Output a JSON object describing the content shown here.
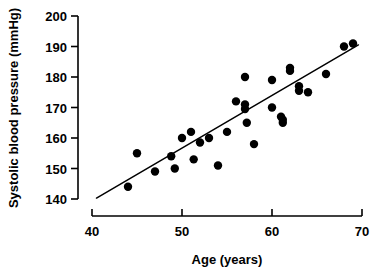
{
  "chart_data": {
    "type": "scatter",
    "title": "",
    "subtitle": "",
    "xlabel": "Age (years)",
    "ylabel": "Systolic blood pressure (mmHg)",
    "xlim": [
      40,
      70
    ],
    "ylim": [
      140,
      200
    ],
    "xticks": [
      40,
      50,
      60,
      70
    ],
    "xtick_labels": [
      "40",
      "50",
      "60",
      "70"
    ],
    "yticks": [
      140,
      150,
      160,
      170,
      180,
      190,
      200
    ],
    "ytick_labels": [
      "140",
      "150",
      "160",
      "170",
      "180",
      "190",
      "200"
    ],
    "grid": false,
    "legend": null,
    "legend_position": "none",
    "marker": "filled-circle",
    "marker_color": "#000000",
    "marker_size": 4.2,
    "series": [
      {
        "name": "Subjects",
        "points": [
          [
            44.0,
            144.0
          ],
          [
            45.0,
            155.0
          ],
          [
            47.0,
            149.0
          ],
          [
            48.8,
            154.0
          ],
          [
            49.2,
            150.0
          ],
          [
            50.0,
            160.0
          ],
          [
            51.0,
            162.0
          ],
          [
            51.3,
            153.0
          ],
          [
            52.0,
            158.5
          ],
          [
            53.0,
            160.0
          ],
          [
            54.0,
            151.0
          ],
          [
            55.0,
            162.0
          ],
          [
            56.0,
            172.0
          ],
          [
            57.0,
            180.0
          ],
          [
            57.0,
            171.0
          ],
          [
            57.0,
            169.5
          ],
          [
            57.2,
            165.0
          ],
          [
            58.0,
            158.0
          ],
          [
            60.0,
            179.0
          ],
          [
            60.0,
            170.0
          ],
          [
            61.0,
            167.0
          ],
          [
            61.2,
            166.0
          ],
          [
            61.2,
            165.0
          ],
          [
            62.0,
            183.0
          ],
          [
            62.0,
            182.0
          ],
          [
            63.0,
            177.0
          ],
          [
            63.0,
            175.5
          ],
          [
            64.0,
            175.0
          ],
          [
            66.0,
            181.0
          ],
          [
            68.0,
            190.0
          ],
          [
            69.0,
            191.0
          ]
        ]
      }
    ],
    "fit_line": {
      "name": "least-squares regression line",
      "x_start": 40.5,
      "y_start": 140.3,
      "x_end": 69.6,
      "y_end": 190.5,
      "color": "#000000"
    }
  },
  "axes": {
    "x_axis_name": "age-axis",
    "y_axis_name": "systolic-pressure-axis"
  }
}
